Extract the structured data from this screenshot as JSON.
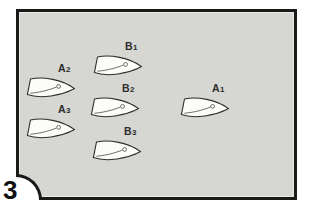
{
  "figure": {
    "number": "3"
  },
  "colors": {
    "page_background": "#ffffff",
    "panel_background": "#d6d6d2",
    "frame_border": "#1a1a1a",
    "boat_fill": "#fcfcfa",
    "boat_outline": "#2e2e2e",
    "label_text": "#2d2d2d",
    "figure_number_text": "#111111"
  },
  "icons": {
    "boat": "boat-hull-shape-pointing-right"
  },
  "boats": [
    {
      "id": "A1",
      "letter": "A",
      "digit": "1"
    },
    {
      "id": "A2",
      "letter": "A",
      "digit": "2"
    },
    {
      "id": "A3",
      "letter": "A",
      "digit": "3"
    },
    {
      "id": "B1",
      "letter": "B",
      "digit": "1"
    },
    {
      "id": "B2",
      "letter": "B",
      "digit": "2"
    },
    {
      "id": "B3",
      "letter": "B",
      "digit": "3"
    }
  ]
}
